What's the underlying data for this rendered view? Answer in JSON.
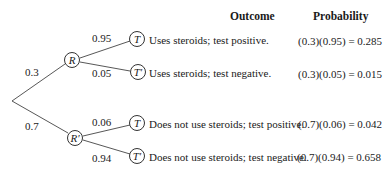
{
  "headers": {
    "outcome": "Outcome",
    "probability": "Probability"
  },
  "root": {
    "branches": [
      {
        "prob_label": "0.3",
        "node_label": "R",
        "branches": [
          {
            "prob_label": "0.95",
            "node_label": "T",
            "outcome": "Uses steroids; test positive.",
            "probability": "(0.3)(0.95) = 0.285"
          },
          {
            "prob_label": "0.05",
            "node_label": "T′",
            "outcome": "Uses steroids; test negative.",
            "probability": "(0.3)(0.05) = 0.015"
          }
        ]
      },
      {
        "prob_label": "0.7",
        "node_label": "R′",
        "branches": [
          {
            "prob_label": "0.06",
            "node_label": "T",
            "outcome": "Does not use steroids; test positive.",
            "probability": "(0.7)(0.06) = 0.042"
          },
          {
            "prob_label": "0.94",
            "node_label": "T′",
            "outcome": "Does not use steroids; test negative.",
            "probability": "(0.7)(0.94) = 0.658"
          }
        ]
      }
    ]
  }
}
